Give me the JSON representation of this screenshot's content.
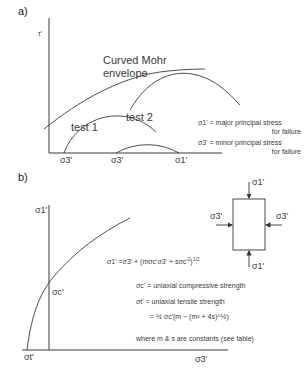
{
  "panel_a": {
    "label": "a)",
    "y_axis_label": "τ'",
    "envelope_label_line1": "Curved Mohr",
    "envelope_label_line2": "envelope",
    "circles": [
      {
        "name": "test 1",
        "sigma3_label": "σ3'",
        "sigma1_label": ""
      },
      {
        "name": "test 2",
        "sigma3_label": "σ3'",
        "sigma1_label": "σ1'"
      }
    ],
    "x_ticks": [
      "σ3'",
      "σ3'",
      "σ1'"
    ],
    "legend": [
      {
        "symbol": "σ1'",
        "text_line1": "= major principal stress",
        "text_line2": "for failure"
      },
      {
        "symbol": "σ3'",
        "text_line1": "= minor principal stress",
        "text_line2": "for failure"
      }
    ]
  },
  "panel_b": {
    "label": "b)",
    "y_axis_label": "σ1'",
    "x_axis_label": "σ3'",
    "sigma_c_label": "σc'",
    "sigma_t_label": "σt'",
    "criterion": {
      "lhs": "σ1' =σ3' + (mσc'σ3' + sσc'",
      "exp_inner": "2",
      "close": ")",
      "exp_outer": "1/2"
    },
    "definitions": [
      {
        "symbol": "σc'",
        "text": "= uniaxial compressive strength"
      },
      {
        "symbol": "σt'",
        "text": "= uniaxial tensile strength"
      }
    ],
    "tensile_formula": "= ½ σc'(m − (m² + 4s)^½)",
    "note": "where m & s are constants (see table)",
    "element": {
      "top_label": "σ1'",
      "bottom_label": "σ1'",
      "left_label": "σ3'",
      "right_label": "σ3'"
    }
  },
  "colors": {
    "line": "#3a3a3a",
    "text": "#3a3a3a",
    "background": "#ffffff"
  }
}
